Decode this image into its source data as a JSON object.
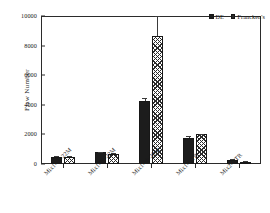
{
  "chart_data": {
    "type": "bar",
    "title": "",
    "xlabel": "",
    "ylabel": "Flaw Number",
    "ylim": [
      0,
      10000
    ],
    "yticks": [
      0,
      2000,
      4000,
      6000,
      8000,
      10000
    ],
    "ytick_labels": [
      "0",
      "2000",
      "4000",
      "6000",
      "8000",
      "10000"
    ],
    "grid": false,
    "legend_position": "top-right",
    "categories": [
      "Mix1-7b-22M",
      "Mix1-7b-22M",
      "Mix1-8b-22M",
      "Mix1-GTR",
      "Mix2-GTR"
    ],
    "series": [
      {
        "name": "DE",
        "fill": "solid-black",
        "values": [
          500,
          780,
          4250,
          1750,
          300
        ],
        "errors": [
          30,
          60,
          190,
          110,
          25
        ]
      },
      {
        "name": "Francken's",
        "fill": "cross-hatch",
        "values": [
          500,
          700,
          8650,
          2000,
          150
        ],
        "errors": [
          25,
          50,
          1350,
          60,
          20
        ]
      }
    ]
  },
  "legend": {
    "items": [
      {
        "label": "DE"
      },
      {
        "label": "Francken's"
      }
    ]
  },
  "colors": {
    "series_de": "#1c1c1c",
    "series_franckens": "#2b2b2b",
    "axis": "#2b2b2b",
    "background": "#ffffff"
  }
}
